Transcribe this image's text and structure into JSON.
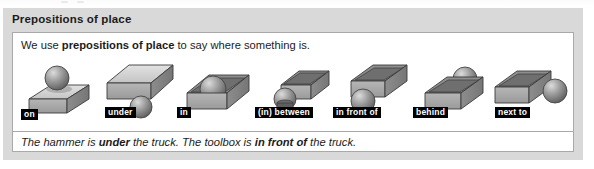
{
  "panel": {
    "title": "Prepositions of place",
    "bg_color": "#d9d9d9"
  },
  "card": {
    "intro": {
      "before": "We use ",
      "bold": "prepositions of place",
      "after": " to say where something is."
    },
    "figures": [
      {
        "label": "on",
        "icon": "box-with-sphere-on-top-icon"
      },
      {
        "label": "under",
        "icon": "sphere-under-slab-icon"
      },
      {
        "label": "in",
        "icon": "sphere-inside-open-box-icon"
      },
      {
        "label": "(in) between",
        "icon": "sphere-between-objects-icon"
      },
      {
        "label": "in front of",
        "icon": "sphere-in-front-of-box-icon"
      },
      {
        "label": "behind",
        "icon": "sphere-behind-box-icon"
      },
      {
        "label": "next to",
        "icon": "sphere-next-to-box-icon"
      }
    ],
    "example": {
      "part1": "The hammer is ",
      "bold1": "under",
      "part2": " the truck. The toolbox is ",
      "bold2": "in front of",
      "part3": " the truck."
    }
  },
  "colors": {
    "label_bg": "#000000",
    "label_text": "#ffffff",
    "card_bg": "#ffffff",
    "card_border": "#a9a9a9",
    "text": "#1b1b1b"
  }
}
